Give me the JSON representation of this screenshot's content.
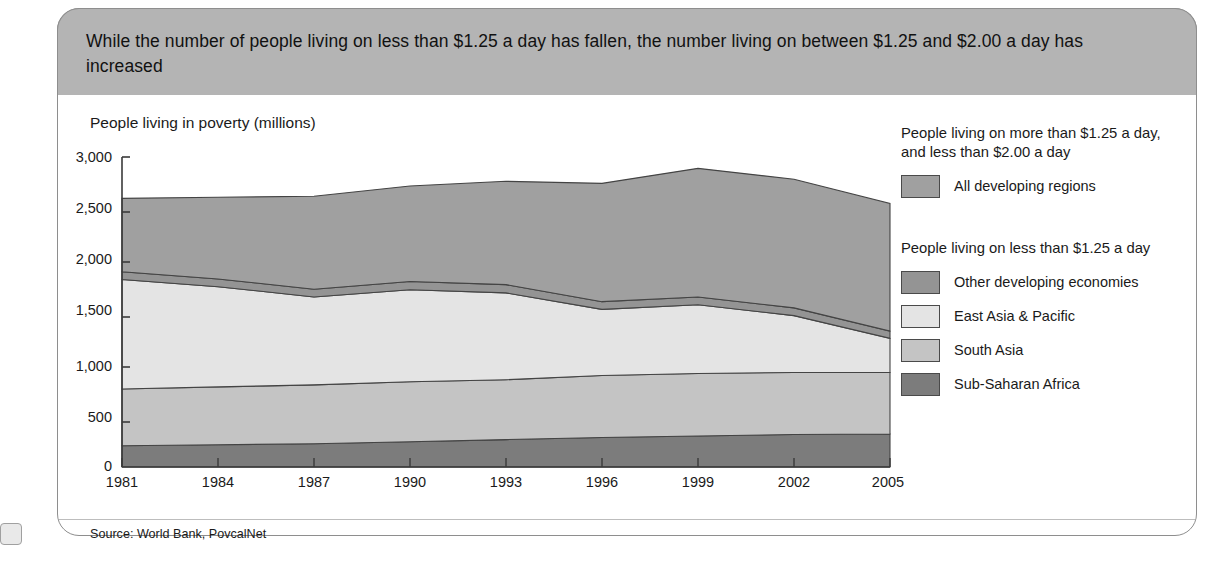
{
  "banner": {
    "headline": "While the number of people living on less than $1.25 a day has fallen, the number living on between $1.25 and $2.00 a day has increased"
  },
  "axis_title": "People living in poverty (millions)",
  "source": "Source: World Bank, PovcalNet",
  "legend": {
    "group1_heading": "People living on more than $1.25 a day, and less than $2.00 a day",
    "group1_items": [
      {
        "label": "All developing regions",
        "color": "#a0a0a0"
      }
    ],
    "group2_heading": "People living on less than $1.25 a day",
    "group2_items": [
      {
        "label": "Other developing economies",
        "color": "#949494"
      },
      {
        "label": "East Asia & Pacific",
        "color": "#e4e4e4"
      },
      {
        "label": "South Asia",
        "color": "#c4c4c4"
      },
      {
        "label": "Sub-Saharan Africa",
        "color": "#7c7c7c"
      }
    ]
  },
  "chart_data": {
    "type": "area",
    "stacked": true,
    "title": "While the number of people living on less than $1.25 a day has fallen, the number living on between $1.25 and $2.00 a day has increased",
    "xlabel": "",
    "ylabel": "People living in poverty (millions)",
    "ylim": [
      0,
      3000
    ],
    "yticks": [
      "0",
      "500",
      "1,000",
      "1,500",
      "2,000",
      "2,500",
      "3,000"
    ],
    "ytick_values": [
      0,
      500,
      1000,
      1500,
      2000,
      2500,
      3000
    ],
    "grid": false,
    "legend_position": "right",
    "x": [
      1981,
      1984,
      1987,
      1990,
      1993,
      1996,
      1999,
      2002,
      2005
    ],
    "xtick_labels": [
      "1981",
      "1984",
      "1987",
      "1990",
      "1993",
      "1996",
      "1999",
      "2002",
      "2005"
    ],
    "series": [
      {
        "name": "Sub-Saharan Africa",
        "color": "#7c7c7c",
        "values": [
          205,
          215,
          225,
          245,
          265,
          285,
          300,
          315,
          320
        ]
      },
      {
        "name": "South Asia",
        "color": "#c4c4c4",
        "values": [
          550,
          560,
          570,
          580,
          580,
          600,
          605,
          600,
          595
        ]
      },
      {
        "name": "East Asia & Pacific",
        "color": "#e4e4e4",
        "values": [
          1060,
          970,
          850,
          890,
          840,
          640,
          665,
          550,
          330
        ]
      },
      {
        "name": "Other developing economies",
        "color": "#949494",
        "values": [
          75,
          75,
          75,
          80,
          80,
          75,
          75,
          75,
          70
        ]
      },
      {
        "name": "All developing regions",
        "color": "#a0a0a0",
        "values": [
          710,
          790,
          900,
          925,
          1000,
          1145,
          1245,
          1245,
          1235
        ]
      }
    ],
    "cumulative_totals": [
      2600,
      2610,
      2620,
      2720,
      2765,
      2745,
      2890,
      2785,
      2550
    ]
  },
  "colors": {
    "banner_bg": "#b4b4b4",
    "card_border": "#8e8e8e",
    "axis": "#3a3a3a",
    "text": "#1a1a1a"
  }
}
